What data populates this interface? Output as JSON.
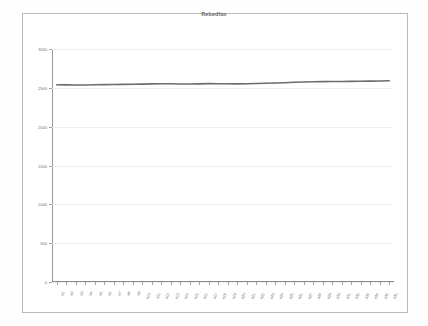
{
  "chart_data": {
    "type": "line",
    "title": "Rebedfas",
    "xlabel": "",
    "ylabel": "",
    "ylim": [
      0,
      3000
    ],
    "yticks": [
      0,
      500,
      1000,
      1500,
      2000,
      2500,
      3000
    ],
    "ytick_labels": [
      "0",
      "500",
      "1000",
      "1500",
      "2000",
      "2500",
      "3000"
    ],
    "grid": true,
    "grid_axis": "y",
    "legend": false,
    "legend_position": "none",
    "line_color": "#6d6d6d",
    "categories": [
      "a1",
      "a2",
      "a3",
      "a4",
      "a5",
      "a6",
      "a7",
      "a8",
      "a9",
      "a10",
      "a11",
      "a12",
      "a13",
      "a14",
      "a15",
      "a16",
      "a17",
      "a18",
      "a19",
      "a20",
      "a21",
      "a22",
      "a23",
      "a24",
      "a25",
      "a26",
      "a27",
      "a28",
      "a29",
      "a30",
      "a31",
      "a32",
      "a33",
      "a34",
      "a35",
      "a36"
    ],
    "series": [
      {
        "name": "series-1",
        "values": [
          2540,
          2538,
          2536,
          2537,
          2539,
          2541,
          2542,
          2544,
          2546,
          2548,
          2551,
          2553,
          2552,
          2550,
          2549,
          2551,
          2554,
          2553,
          2552,
          2551,
          2553,
          2556,
          2559,
          2562,
          2566,
          2571,
          2575,
          2578,
          2580,
          2581,
          2582,
          2583,
          2584,
          2586,
          2588,
          2592
        ]
      }
    ]
  },
  "frame": {
    "border_color": "#b9b9b9"
  }
}
